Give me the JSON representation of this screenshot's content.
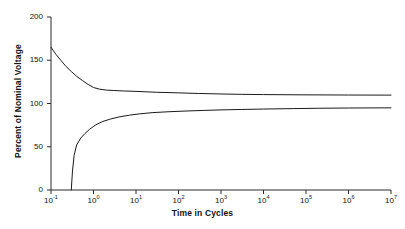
{
  "chart_data": {
    "type": "line",
    "title": "",
    "xlabel": "Time in Cycles",
    "ylabel": "Percent of Nominal Voltage",
    "xscale": "log",
    "yscale": "linear",
    "xlim": [
      0.1,
      10000000
    ],
    "ylim": [
      0,
      200
    ],
    "grid": false,
    "legend": null,
    "xticks": [
      {
        "value": 0.1,
        "label": "10",
        "exp": "-1"
      },
      {
        "value": 1,
        "label": "10",
        "exp": "0"
      },
      {
        "value": 10,
        "label": "10",
        "exp": "1"
      },
      {
        "value": 100,
        "label": "10",
        "exp": "2"
      },
      {
        "value": 1000,
        "label": "10",
        "exp": "3"
      },
      {
        "value": 10000,
        "label": "10",
        "exp": "4"
      },
      {
        "value": 100000,
        "label": "10",
        "exp": "5"
      },
      {
        "value": 1000000,
        "label": "10",
        "exp": "6"
      },
      {
        "value": 10000000,
        "label": "10",
        "exp": "7"
      }
    ],
    "yticks": [
      0,
      50,
      100,
      150,
      200
    ],
    "series": [
      {
        "name": "Upper voltage tolerance envelope",
        "color": "#1a1a1a",
        "points": [
          [
            0.1,
            165.0
          ],
          [
            0.13,
            157.0
          ],
          [
            0.17,
            150.0
          ],
          [
            0.22,
            143.5
          ],
          [
            0.3,
            137.0
          ],
          [
            0.4,
            131.5
          ],
          [
            0.55,
            126.5
          ],
          [
            0.75,
            122.0
          ],
          [
            1.0,
            118.5
          ],
          [
            1.4,
            116.5
          ],
          [
            2.0,
            115.5
          ],
          [
            3.0,
            115.0
          ],
          [
            5.0,
            114.5
          ],
          [
            10.0,
            114.0
          ],
          [
            30.0,
            113.0
          ],
          [
            100.0,
            112.3
          ],
          [
            300.0,
            111.6
          ],
          [
            1000.0,
            111.0
          ],
          [
            3000.0,
            110.6
          ],
          [
            10000.0,
            110.3
          ],
          [
            100000.0,
            110.0
          ],
          [
            1000000.0,
            109.8
          ],
          [
            10000000.0,
            109.7
          ]
        ]
      },
      {
        "name": "Lower voltage tolerance envelope",
        "color": "#1a1a1a",
        "points": [
          [
            0.3,
            0.0
          ],
          [
            0.32,
            22.0
          ],
          [
            0.35,
            40.0
          ],
          [
            0.4,
            52.0
          ],
          [
            0.5,
            60.0
          ],
          [
            0.62,
            65.0
          ],
          [
            0.8,
            70.0
          ],
          [
            1.1,
            75.0
          ],
          [
            1.6,
            79.0
          ],
          [
            2.5,
            82.0
          ],
          [
            4.0,
            84.5
          ],
          [
            7.0,
            86.5
          ],
          [
            12.0,
            88.0
          ],
          [
            25.0,
            89.5
          ],
          [
            60.0,
            90.5
          ],
          [
            150.0,
            91.3
          ],
          [
            400.0,
            92.0
          ],
          [
            1000.0,
            92.6
          ],
          [
            3000.0,
            93.1
          ],
          [
            10000.0,
            93.6
          ],
          [
            50000.0,
            94.1
          ],
          [
            200000.0,
            94.5
          ],
          [
            1000000.0,
            94.8
          ],
          [
            10000000.0,
            95.0
          ]
        ]
      }
    ]
  }
}
